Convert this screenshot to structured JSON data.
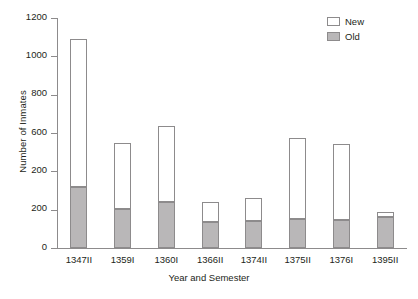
{
  "chart_data": {
    "type": "bar",
    "subtype": "stacked",
    "title": "",
    "xlabel": "Year and Semester",
    "ylabel": "Number of Inmates",
    "categories": [
      "1347II",
      "1359I",
      "1360I",
      "1366II",
      "1374II",
      "1375II",
      "1376I",
      "1395II"
    ],
    "series": [
      {
        "name": "Old",
        "color": "#b9b7b8",
        "values": [
          320,
          205,
          240,
          135,
          140,
          150,
          145,
          160
        ]
      },
      {
        "name": "New",
        "color": "#ffffff",
        "values": [
          770,
          345,
          395,
          105,
          120,
          425,
          400,
          30
        ]
      }
    ],
    "totals": [
      1090,
      550,
      635,
      240,
      260,
      575,
      545,
      190
    ],
    "ylim": [
      0,
      1200
    ],
    "ytick_values": [
      0,
      200,
      400,
      600,
      800,
      1000,
      1200
    ],
    "ytick_labels": [
      "0",
      "200",
      "200",
      "600",
      "800",
      "1000",
      "1200"
    ],
    "grid": false,
    "legend_position": "top-right",
    "note": "The y-axis tick at the 400 position is labeled '200' in the source figure."
  },
  "legend": {
    "items": [
      {
        "label": "New",
        "swatch": "new"
      },
      {
        "label": "Old",
        "swatch": "old"
      }
    ]
  }
}
